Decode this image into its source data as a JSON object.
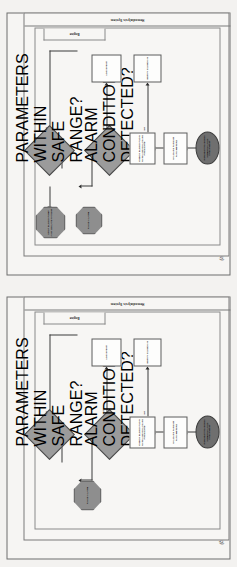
{
  "document": {
    "background_color": "#f3f2f0",
    "orientation": "rotated-90",
    "figure_count": 2
  },
  "figures": [
    {
      "caption": "(a)",
      "pool_label": "Hemodialysis System",
      "lane_label": "Engine",
      "nodes": {
        "start": "REQUEST TO BEGIN HEMODIALYSIS TREATMENT",
        "task1": "VALIDATE PATIENT PARAMETERS",
        "task2": "CHECK BLOOD FLOW RATE AND DIALYSATE PRESSURE",
        "decision1": "PARAMETERS WITHIN SAFE RANGE?",
        "decision2": "ALARM CONDITION DETECTED?",
        "octagon1": "RAISE ALARM",
        "octagon2": "STOP BLOOD PUMP AND ISOLATE PATIENT",
        "rect_right1": "LOG EVENT",
        "rect_right2": "NOTIFY CLINICIAN"
      },
      "edge_labels": {
        "d1_no": "NO",
        "d1_yes": "YES",
        "d2_yes": "YES",
        "d2_no": "NO"
      }
    },
    {
      "caption": "(b)",
      "pool_label": "Hemodialysis System",
      "lane_label": "Engine",
      "nodes": {
        "start": "REQUEST TO BEGIN HEMODIALYSIS TREATMENT",
        "task1": "VALIDATE PATIENT PARAMETERS",
        "task2": "CHECK BLOOD FLOW RATE AND DIALYSATE PRESSURE",
        "decision1": "PARAMETERS WITHIN SAFE RANGE?",
        "decision2": "ALARM CONDITION DETECTED?",
        "octagon1": "RAISE ALARM",
        "octagon2": "STOP BLOOD PUMP AND ISOLATE PATIENT",
        "rect_right1": "LOG EVENT",
        "rect_right2": "NOTIFY CLINICIAN"
      },
      "edge_labels": {
        "d1_no": "NO",
        "d1_yes": "YES",
        "d2_yes": "YES",
        "d2_no": "NO"
      }
    }
  ],
  "colors": {
    "octagon_fill": "#8e8e8e",
    "diamond_fill": "#9b9b9b",
    "ellipse_fill": "#6f6f6f",
    "rect_fill": "#fdfdfc",
    "line": "#3a3a3a",
    "frame": "#6d6d6d"
  }
}
